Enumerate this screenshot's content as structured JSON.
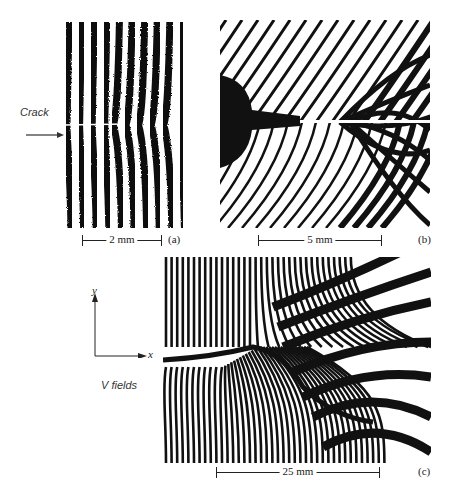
{
  "figure": {
    "panels": [
      {
        "id": "a",
        "label": "(a)",
        "scale_bar": "2 mm",
        "annotation": "Crack",
        "description": "Moire fringe pattern: near-vertical dark/light fringes with crack from the left edge"
      },
      {
        "id": "b",
        "label": "(b)",
        "scale_bar": "5 mm",
        "description": "Fringes radiating around a notch (black blob) and crack tip"
      },
      {
        "id": "c",
        "label": "(c)",
        "scale_bar": "25 mm",
        "description": "V-field fringe pattern around a crack"
      }
    ],
    "axes": {
      "x_label": "x",
      "y_label": "y"
    },
    "field_label": "V fields"
  },
  "colors": {
    "fringe_dark": "#111111",
    "background": "#ffffff"
  }
}
